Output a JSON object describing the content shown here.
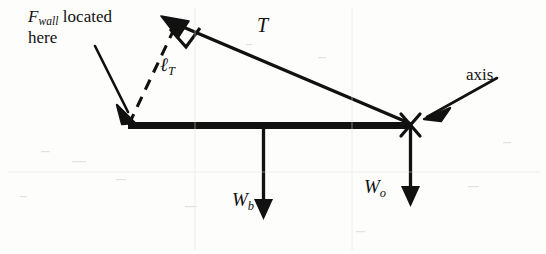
{
  "figure": {
    "type": "free-body-diagram",
    "background_color": "#fdfdfc",
    "ink_color": "#111111"
  },
  "annotations": {
    "fwall": {
      "symbol": "F",
      "subscript": "wall",
      "text_after": " located",
      "line2": "here",
      "pointer": "arrow pointing down-right to left end of beam"
    },
    "tension_label": "T",
    "moment_arm": {
      "symbol": "ℓ",
      "subscript": "T"
    },
    "axis_label": "axis",
    "weight_beam": {
      "symbol": "W",
      "subscript": "b"
    },
    "weight_object": {
      "symbol": "W",
      "subscript": "o"
    }
  },
  "geometry": {
    "beam": {
      "x1": 128,
      "y1": 125,
      "x2": 411,
      "y2": 125,
      "thickness": 7
    },
    "tension_vector": {
      "from_x": 410,
      "from_y": 124,
      "to_x": 166,
      "to_y": 20
    },
    "moment_arm_dashed": {
      "from_x": 128,
      "from_y": 124,
      "to_x": 178,
      "to_y": 24
    },
    "right_angle_marker": {
      "x": 183,
      "y": 33
    },
    "pivot_cross": {
      "x": 410,
      "y": 125,
      "size": 11
    },
    "weight_beam_arrow": {
      "x": 263,
      "y1": 127,
      "y2": 219
    },
    "weight_object_arrow": {
      "x": 410,
      "y1": 127,
      "y2": 206
    },
    "fwall_pointer_arrow": {
      "x1": 96,
      "y1": 47,
      "x2": 131,
      "y2": 120
    },
    "axis_pointer_arrow": {
      "x1": 497,
      "y1": 79,
      "x2": 425,
      "y2": 119
    }
  }
}
